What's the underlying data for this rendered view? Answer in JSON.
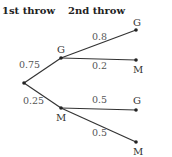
{
  "headers": {
    "first": "1st throw",
    "second": "2nd throw"
  },
  "tree": {
    "root": {
      "x": 24,
      "y": 83
    },
    "first_level": [
      {
        "label": "G",
        "prob": "0.75",
        "x": 61,
        "y": 58,
        "label_x": 57,
        "label_y": 53,
        "prob_x": 19,
        "prob_y": 68
      },
      {
        "label": "M",
        "prob": "0.25",
        "x": 61,
        "y": 108,
        "label_x": 56,
        "label_y": 121,
        "prob_x": 23,
        "prob_y": 104
      }
    ],
    "second_level": [
      {
        "parent": 0,
        "label": "G",
        "prob": "0.8",
        "x": 136,
        "y": 30,
        "label_x": 133,
        "label_y": 26,
        "prob_x": 92,
        "prob_y": 40
      },
      {
        "parent": 0,
        "label": "M",
        "prob": "0.2",
        "x": 136,
        "y": 60,
        "label_x": 133,
        "label_y": 73,
        "prob_x": 92,
        "prob_y": 69
      },
      {
        "parent": 1,
        "label": "G",
        "prob": "0.5",
        "x": 136,
        "y": 110,
        "label_x": 133,
        "label_y": 104,
        "prob_x": 92,
        "prob_y": 103
      },
      {
        "parent": 1,
        "label": "M",
        "prob": "0.5",
        "x": 136,
        "y": 142,
        "label_x": 133,
        "label_y": 155,
        "prob_x": 92,
        "prob_y": 136
      }
    ]
  }
}
